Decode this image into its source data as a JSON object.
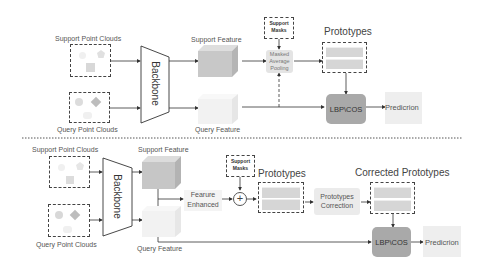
{
  "top_panel": {
    "support_point_clouds": "Support Point Clouds",
    "query_point_clouds": "Query Point Clouds",
    "backbone": "Backbone",
    "support_feature": "Support Feature",
    "query_feature": "Query Feature",
    "support_masks_line1": "Support",
    "support_masks_line2": "Masks",
    "map_line1": "Masked",
    "map_line2": "Average",
    "map_line3": "Pooling",
    "prototypes": "Prototypes",
    "lbp_cos": "LBP\\COS",
    "prediction": "Predicrion"
  },
  "bottom_panel": {
    "support_point_clouds": "Support Point Clouds",
    "query_point_clouds": "Query Point Clouds",
    "backbone": "Backbone",
    "support_feature": "Support Feature",
    "query_feature": "Query Feature",
    "feature_enhanced_line1": "Fearure",
    "feature_enhanced_line2": "Enhanced",
    "support_masks_line1": "Support",
    "support_masks_line2": "Masks",
    "plus": "+",
    "prototypes": "Prototypes",
    "correction_line1": "Prototypes",
    "correction_line2": "Correction",
    "corrected_prototypes": "Corrected Prototypes",
    "lbp_cos": "LBP\\COS",
    "prediction": "Predicrion"
  },
  "colors": {
    "line": "#333333",
    "lbp_box": "#a9a9a9",
    "gray_box": "#e4e4e4",
    "support_cube": "#c8c8c8",
    "query_cube": "#f0f0f0"
  }
}
